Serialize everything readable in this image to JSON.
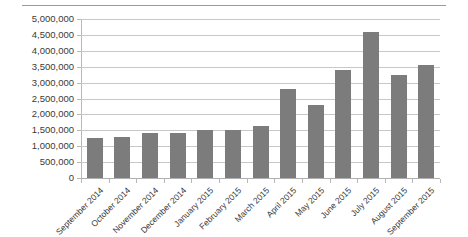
{
  "chart_data": {
    "type": "bar",
    "title": "",
    "subtitle": "",
    "xlabel": "",
    "ylabel": "",
    "categories": [
      "September 2014",
      "October 2014",
      "November 2014",
      "December 2014",
      "January 2015",
      "February 2015",
      "March 2015",
      "April 2015",
      "May 2015",
      "June 2015",
      "July 2015",
      "August 2015",
      "September 2015"
    ],
    "values": [
      1250000,
      1300000,
      1400000,
      1420000,
      1500000,
      1520000,
      1650000,
      2800000,
      2300000,
      3400000,
      4600000,
      3250000,
      3550000
    ],
    "ylim": [
      0,
      5000000
    ],
    "ytick_values": [
      0,
      500000,
      1000000,
      1500000,
      2000000,
      2500000,
      3000000,
      3500000,
      4000000,
      4500000,
      5000000
    ],
    "ytick_labels": [
      "0",
      "500,000",
      "1,000,000",
      "1,500,000",
      "2,000,000",
      "2,500,000",
      "3,000,000",
      "3,500,000",
      "4,000,000",
      "4,500,000",
      "5,000,000"
    ],
    "grid": true,
    "legend": false,
    "legend_position": "none",
    "series_color": "#7c7c7c",
    "gridline_color": "#c8c8c8",
    "axis_color": "#b8b8b8",
    "background": "#ffffff"
  }
}
